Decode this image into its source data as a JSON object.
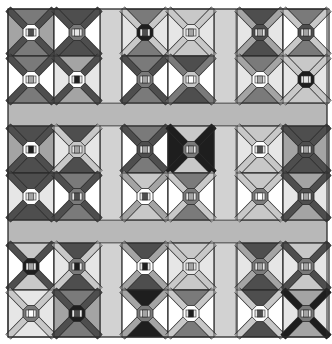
{
  "palette": {
    "W": "#ffffff",
    "L": "#e6e6e6",
    "A": "#c8c8c8",
    "M": "#a4a4a4",
    "D": "#7a7a7a",
    "K": "#4e4e4e",
    "X": "#1e1e1e",
    "outline": "#2a2a2a",
    "sashing": "#b8b8b8",
    "sashing_light": "#d2d2d2"
  },
  "quilt": {
    "group_rows": 3,
    "group_cols": 3,
    "blocks_per_group": 2,
    "blocks": [
      [
        {
          "tb": "D",
          "lr": "M",
          "band": "K",
          "oct": "W",
          "core": "K"
        },
        {
          "tb": "K",
          "lr": "W",
          "band": "K",
          "oct": "D",
          "core": "L"
        },
        {
          "tb": "D",
          "lr": "L",
          "band": "A",
          "oct": "X",
          "core": "K"
        },
        {
          "tb": "A",
          "lr": "L",
          "band": "A",
          "oct": "L",
          "core": "M"
        },
        {
          "tb": "K",
          "lr": "L",
          "band": "M",
          "oct": "K",
          "core": "M"
        },
        {
          "tb": "D",
          "lr": "W",
          "band": "A",
          "oct": "K",
          "core": "M"
        }
      ],
      [
        {
          "tb": "D",
          "lr": "W",
          "band": "K",
          "oct": "W",
          "core": "M"
        },
        {
          "tb": "M",
          "lr": "L",
          "band": "K",
          "oct": "W",
          "core": "X"
        },
        {
          "tb": "D",
          "lr": "W",
          "band": "K",
          "oct": "D",
          "core": "M"
        },
        {
          "tb": "K",
          "lr": "W",
          "band": "D",
          "oct": "A",
          "core": "W"
        },
        {
          "tb": "D",
          "lr": "L",
          "band": "M",
          "oct": "W",
          "core": "M"
        },
        {
          "tb": "A",
          "lr": "L",
          "band": "A",
          "oct": "X",
          "core": "L"
        }
      ],
      [
        {
          "tb": "K",
          "lr": "M",
          "band": "K",
          "oct": "W",
          "core": "X"
        },
        {
          "tb": "K",
          "lr": "L",
          "band": "A",
          "oct": "A",
          "core": "M"
        },
        {
          "tb": "D",
          "lr": "W",
          "band": "K",
          "oct": "K",
          "core": "M"
        },
        {
          "tb": "A",
          "lr": "X",
          "band": "X",
          "oct": "D",
          "core": "M"
        },
        {
          "tb": "A",
          "lr": "L",
          "band": "A",
          "oct": "W",
          "core": "K"
        },
        {
          "tb": "K",
          "lr": "M",
          "band": "K",
          "oct": "K",
          "core": "M"
        }
      ],
      [
        {
          "tb": "K",
          "lr": "L",
          "band": "K",
          "oct": "W",
          "core": "M"
        },
        {
          "tb": "D",
          "lr": "W",
          "band": "K",
          "oct": "D",
          "core": "K"
        },
        {
          "tb": "A",
          "lr": "W",
          "band": "M",
          "oct": "W",
          "core": "K"
        },
        {
          "tb": "D",
          "lr": "W",
          "band": "A",
          "oct": "D",
          "core": "M"
        },
        {
          "tb": "A",
          "lr": "W",
          "band": "A",
          "oct": "D",
          "core": "W"
        },
        {
          "tb": "M",
          "lr": "L",
          "band": "K",
          "oct": "K",
          "core": "M"
        }
      ],
      [
        {
          "tb": "A",
          "lr": "W",
          "band": "K",
          "oct": "X",
          "core": "M"
        },
        {
          "tb": "K",
          "lr": "L",
          "band": "A",
          "oct": "D",
          "core": "X"
        },
        {
          "tb": "K",
          "lr": "W",
          "band": "M",
          "oct": "W",
          "core": "X"
        },
        {
          "tb": "A",
          "lr": "L",
          "band": "A",
          "oct": "L",
          "core": "M"
        },
        {
          "tb": "K",
          "lr": "L",
          "band": "M",
          "oct": "D",
          "core": "M"
        },
        {
          "tb": "A",
          "lr": "L",
          "band": "K",
          "oct": "D",
          "core": "M"
        }
      ],
      [
        {
          "tb": "L",
          "lr": "L",
          "band": "A",
          "oct": "D",
          "core": "W"
        },
        {
          "tb": "D",
          "lr": "M",
          "band": "K",
          "oct": "X",
          "core": "K"
        },
        {
          "tb": "X",
          "lr": "W",
          "band": "M",
          "oct": "D",
          "core": "M"
        },
        {
          "tb": "D",
          "lr": "W",
          "band": "A",
          "oct": "W",
          "core": "X"
        },
        {
          "tb": "K",
          "lr": "W",
          "band": "A",
          "oct": "W",
          "core": "K"
        },
        {
          "tb": "M",
          "lr": "L",
          "band": "X",
          "oct": "D",
          "core": "M"
        }
      ]
    ]
  }
}
